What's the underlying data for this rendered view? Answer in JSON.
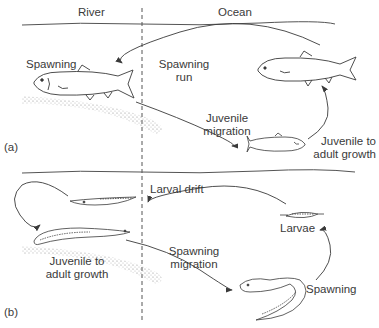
{
  "header": {
    "left_region": "River",
    "right_region": "Ocean"
  },
  "panel_a": {
    "label": "(a)",
    "organism": "salmon",
    "stages": {
      "spawning": "Spawning",
      "spawning_run_1": "Spawning",
      "spawning_run_2": "run",
      "juvenile_migration_1": "Juvenile",
      "juvenile_migration_2": "migration",
      "juvenile_growth_1": "Juvenile to",
      "juvenile_growth_2": "adult growth"
    }
  },
  "panel_b": {
    "label": "(b)",
    "organism": "eel",
    "stages": {
      "larval_drift": "Larval drift",
      "larvae": "Larvae",
      "juvenile_growth_1": "Juvenile to",
      "juvenile_growth_2": "adult growth",
      "spawning_migration_1": "Spawning",
      "spawning_migration_2": "migration",
      "spawning": "Spawning"
    }
  },
  "colors": {
    "ink": "#3a3a3a",
    "background": "#ffffff",
    "gravel": "#9a9a9a"
  }
}
